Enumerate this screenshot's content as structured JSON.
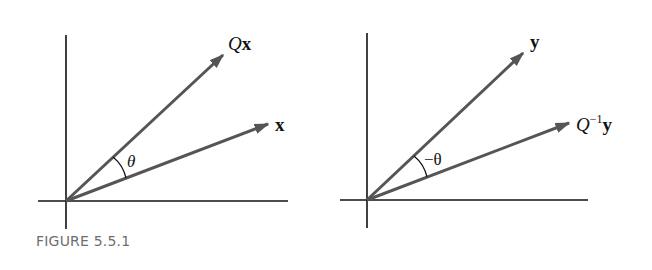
{
  "figure": {
    "caption": "FIGURE 5.5.1",
    "colors": {
      "axis": "#111111",
      "vector": "#555555",
      "label": "#111111",
      "caption": "#6e6e6e"
    },
    "panels": [
      {
        "id": "left",
        "vectors": [
          {
            "label_main": "Q",
            "label_bold": "x",
            "label_sup": "",
            "description": "rotated vector Qx"
          },
          {
            "label_main": "",
            "label_bold": "x",
            "label_sup": "",
            "description": "vector x"
          }
        ],
        "angle_label": "θ"
      },
      {
        "id": "right",
        "vectors": [
          {
            "label_main": "",
            "label_bold": "y",
            "label_sup": "",
            "description": "vector y"
          },
          {
            "label_main": "Q",
            "label_bold": "y",
            "label_sup": "−1",
            "description": "rotated vector Q^-1 y"
          }
        ],
        "angle_label": "−θ"
      }
    ]
  }
}
